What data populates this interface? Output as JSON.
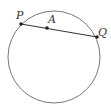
{
  "diagram": {
    "type": "geometry",
    "circle": {
      "cx": 54,
      "cy": 57,
      "r": 46,
      "stroke": "#777777"
    },
    "chord": {
      "from": "P",
      "to": "Q",
      "stroke": "#333333"
    },
    "points": [
      {
        "id": "P",
        "label": "P",
        "x": 21,
        "y": 24,
        "label_x": 16,
        "label_y": 19
      },
      {
        "id": "A",
        "label": "A",
        "x": 47,
        "y": 28,
        "label_x": 48,
        "label_y": 23
      },
      {
        "id": "Q",
        "label": "Q",
        "x": 97,
        "y": 37,
        "label_x": 98,
        "label_y": 36
      }
    ],
    "point_color": "#222222"
  }
}
